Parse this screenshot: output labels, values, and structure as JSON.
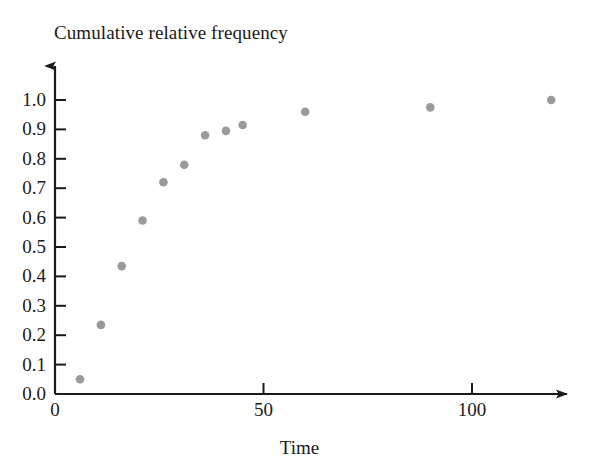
{
  "chart_data": {
    "type": "scatter",
    "title": "Cumulative relative frequency",
    "xlabel": "Time",
    "ylabel": "",
    "xlim": [
      0,
      125
    ],
    "ylim": [
      0.0,
      1.05
    ],
    "grid": false,
    "legend": "none",
    "marker_color": "#9a9a9a",
    "axis_color": "#1a1a1a",
    "xticks": [
      0,
      50,
      100
    ],
    "xtick_labels": [
      "0",
      "50",
      "100"
    ],
    "yticks": [
      0.0,
      0.1,
      0.2,
      0.3,
      0.4,
      0.5,
      0.6,
      0.7,
      0.8,
      0.9,
      1.0
    ],
    "ytick_labels": [
      "0.0",
      "0.1",
      "0.2",
      "0.3",
      "0.4",
      "0.5",
      "0.6",
      "0.7",
      "0.8",
      "0.9",
      "1.0"
    ],
    "x": [
      6,
      11,
      16,
      21,
      26,
      31,
      36,
      41,
      45,
      60,
      90,
      119
    ],
    "y": [
      0.05,
      0.235,
      0.435,
      0.59,
      0.72,
      0.78,
      0.88,
      0.895,
      0.915,
      0.96,
      0.975,
      1.0
    ],
    "points": [
      {
        "x": 6,
        "y": 0.05
      },
      {
        "x": 11,
        "y": 0.235
      },
      {
        "x": 16,
        "y": 0.435
      },
      {
        "x": 21,
        "y": 0.59
      },
      {
        "x": 26,
        "y": 0.72
      },
      {
        "x": 31,
        "y": 0.78
      },
      {
        "x": 36,
        "y": 0.88
      },
      {
        "x": 41,
        "y": 0.895
      },
      {
        "x": 45,
        "y": 0.915
      },
      {
        "x": 60,
        "y": 0.96
      },
      {
        "x": 90,
        "y": 0.975
      },
      {
        "x": 119,
        "y": 1.0
      }
    ]
  },
  "axes": {
    "x_arrow": true,
    "y_arrow": true
  }
}
